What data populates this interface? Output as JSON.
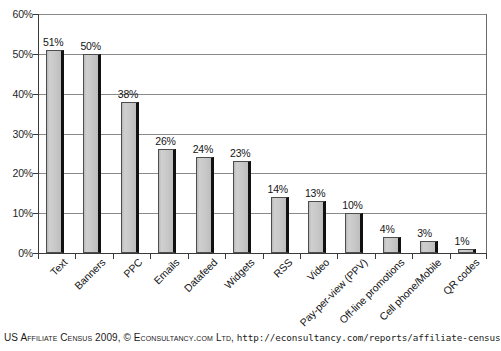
{
  "chart_data": {
    "type": "bar",
    "title": "",
    "xlabel": "",
    "ylabel": "",
    "ylim": [
      0,
      60
    ],
    "ytick_step": 10,
    "ytick_labels": [
      "0%",
      "10%",
      "20%",
      "30%",
      "40%",
      "50%",
      "60%"
    ],
    "grid": true,
    "legend": false,
    "value_suffix": "%",
    "categories": [
      "Text",
      "Banners",
      "PPC",
      "Emails",
      "Datafeed",
      "Widgets",
      "RSS",
      "Video",
      "Pay-per-view (PPV)",
      "Off-line promotions",
      "Cell phone/Mobile",
      "QR codes"
    ],
    "values": [
      51,
      50,
      38,
      26,
      24,
      23,
      14,
      13,
      10,
      4,
      3,
      1
    ],
    "value_labels": [
      "51%",
      "50%",
      "38%",
      "26%",
      "24%",
      "23%",
      "14%",
      "13%",
      "10%",
      "4%",
      "3%",
      "1%"
    ],
    "bar_fill_color": "#c4c4c4",
    "bar_edge_color": "#4d4d4d",
    "bar_shadow_color": "#111111",
    "gridline_color": "#8a8a8a",
    "axis_color": "#3a3a3a"
  },
  "caption": {
    "source": "US Affiliate Census 2009,",
    "copyright": "© Econsultancy.com Ltd,",
    "url": "http://econsultancy.com/reports/affiliate-census"
  }
}
